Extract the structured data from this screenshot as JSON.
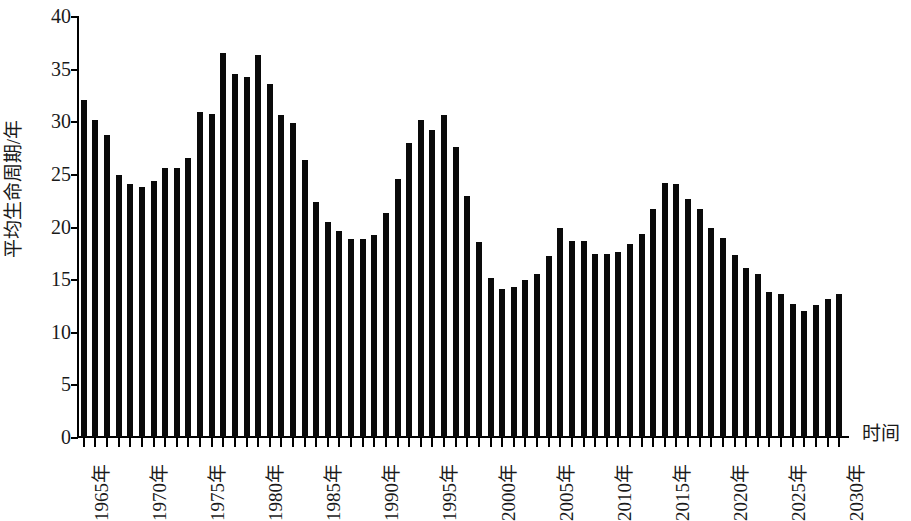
{
  "chart_data": {
    "type": "bar",
    "title": "",
    "xlabel": "时间",
    "ylabel": "平均生命周期/年",
    "ylim": [
      0,
      40
    ],
    "ytick_values": [
      0,
      5,
      10,
      15,
      20,
      25,
      30,
      35,
      40
    ],
    "ytick_labels": [
      "0",
      "5",
      "10",
      "15",
      "20",
      "25",
      "30",
      "35",
      "40"
    ],
    "grid": false,
    "legend": null,
    "bar_color": "#0a0a0a",
    "axis_color": "#000000",
    "xtick_labels": [
      "1965年",
      "1970年",
      "1975年",
      "1980年",
      "1985年",
      "1990年",
      "1995年",
      "2000年",
      "2005年",
      "2010年",
      "2015年",
      "2020年",
      "2025年",
      "2030年"
    ],
    "xtick_categories": [
      1965,
      1970,
      1975,
      1980,
      1985,
      1990,
      1995,
      2000,
      2005,
      2010,
      2015,
      2020,
      2025,
      2030
    ],
    "categories": [
      1965,
      1966,
      1967,
      1968,
      1969,
      1970,
      1971,
      1972,
      1973,
      1974,
      1975,
      1976,
      1977,
      1978,
      1979,
      1980,
      1981,
      1982,
      1983,
      1984,
      1985,
      1986,
      1987,
      1988,
      1989,
      1990,
      1991,
      1992,
      1993,
      1994,
      1995,
      1996,
      1997,
      1998,
      1999,
      2000,
      2001,
      2002,
      2003,
      2004,
      2005,
      2006,
      2007,
      2008,
      2009,
      2010,
      2011,
      2012,
      2013,
      2014,
      2015,
      2016,
      2017,
      2018,
      2019,
      2020,
      2021,
      2022,
      2023,
      2024,
      2025,
      2026,
      2027,
      2028,
      2029,
      2030
    ],
    "values": [
      32.0,
      30.1,
      28.7,
      24.9,
      24.0,
      23.8,
      24.3,
      25.6,
      25.6,
      26.5,
      30.9,
      30.7,
      36.5,
      34.5,
      34.2,
      36.3,
      33.5,
      30.6,
      29.8,
      26.3,
      22.3,
      20.4,
      19.6,
      18.8,
      18.8,
      19.2,
      21.3,
      24.5,
      27.9,
      30.1,
      29.2,
      30.6,
      27.6,
      22.9,
      18.5,
      15.1,
      14.1,
      14.3,
      14.9,
      15.5,
      17.2,
      19.9,
      18.6,
      18.6,
      17.4,
      17.4,
      17.6,
      18.3,
      19.3,
      21.7,
      24.1,
      24.0,
      22.6,
      21.7,
      19.9,
      18.9,
      17.3,
      16.1,
      15.5,
      13.8,
      13.6,
      12.6,
      12.0,
      12.5,
      13.1,
      13.6
    ]
  }
}
